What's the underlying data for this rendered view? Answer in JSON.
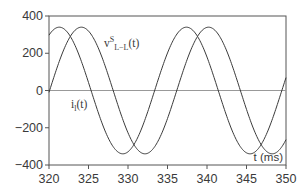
{
  "chart_data": {
    "type": "line",
    "title": "",
    "xlabel": "t (ms)",
    "ylabel": "",
    "xlim": [
      320,
      350
    ],
    "ylim": [
      -400,
      400
    ],
    "xticks": [
      320,
      325,
      330,
      335,
      340,
      345,
      350
    ],
    "yticks": [
      400,
      200,
      0,
      -200,
      -400
    ],
    "grid": false,
    "zero_line": true,
    "legend": "inline labels",
    "series": [
      {
        "name": "v^S_L-L(t)",
        "label_main": "v",
        "label_sup": "S",
        "label_sub": "L−L",
        "label_tail": "(t)",
        "amplitude": 340,
        "period_ms": 16.1,
        "peak_times_ms": [
          324.1,
          340.2
        ],
        "trough_times_ms": [
          332.1,
          348.2
        ],
        "zero_crossings_ms": [
          328.1,
          336.1,
          344.2
        ],
        "value_at_320": 80,
        "color": "#3a3a3a"
      },
      {
        "name": "i_l(t)",
        "label_main": "i",
        "label_sub": "l",
        "label_tail": "(t)",
        "amplitude": 340,
        "period_ms": 16.1,
        "peak_times_ms": [
          321.3,
          337.4
        ],
        "trough_times_ms": [
          329.3,
          345.4
        ],
        "zero_crossings_ms": [
          325.3,
          333.4,
          341.4,
          349.7
        ],
        "color": "#3a3a3a"
      }
    ]
  },
  "labels": {
    "x_axis": "t (ms)",
    "x_ticks": [
      "320",
      "325",
      "330",
      "335",
      "340",
      "345",
      "350"
    ],
    "y_ticks": [
      "400",
      "200",
      "0",
      "−200",
      "−400"
    ],
    "v_main": "v",
    "v_sup": "S",
    "v_sub": "L−L",
    "v_tail": "(t)",
    "i_main": "i",
    "i_sub": "l",
    "i_tail": "(t)"
  }
}
